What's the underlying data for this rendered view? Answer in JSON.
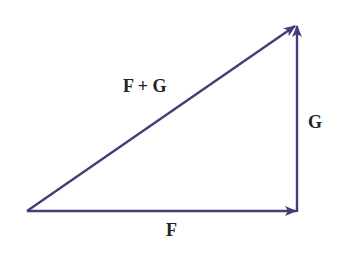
{
  "diagram": {
    "type": "vector-addition-triangle",
    "colors": {
      "vector": "#4a3a7a",
      "label": "#222222",
      "background": "#ffffff"
    },
    "points": {
      "origin": [
        27,
        211
      ],
      "corner": [
        297,
        211
      ],
      "tip": [
        297,
        25
      ]
    },
    "vectors": [
      {
        "name": "F",
        "from": "origin",
        "to": "corner"
      },
      {
        "name": "G",
        "from": "corner",
        "to": "tip"
      },
      {
        "name": "F + G",
        "from": "origin",
        "to": "tip"
      }
    ],
    "labels": {
      "f": "F",
      "g": "G",
      "f_plus_g": "F + G"
    }
  }
}
